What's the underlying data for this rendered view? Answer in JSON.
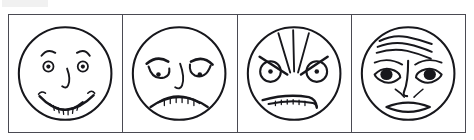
{
  "figure": {
    "panel_count": 4,
    "frame": {
      "stroke_color": "#4a4a52",
      "background": "#ffffff"
    },
    "ink_color": "#17171c"
  },
  "panels": [
    {
      "id": "panel-happy",
      "expression": "happy",
      "label": "Happy face",
      "features": {
        "eyes": "small round eyes with pupils",
        "eyebrows": "short arched brows",
        "nose": "single curved line",
        "mouth": "upturned smile with teeth row"
      }
    },
    {
      "id": "panel-sad",
      "expression": "sad",
      "label": "Sad face",
      "features": {
        "eyes": "droopy lidded eyes with pupils",
        "eyebrows": "inner-raised slanted brows",
        "nose": "single curved line",
        "mouth": "downturned frown with teeth row"
      }
    },
    {
      "id": "panel-angry",
      "expression": "angry",
      "label": "Angry face",
      "features": {
        "eyes": "round eyes with small pupils",
        "eyebrows": "sharp V brows with radiating furrow lines",
        "nose": "none visible",
        "mouth": "flat wavy mouth with teeth row"
      }
    },
    {
      "id": "panel-fear",
      "expression": "fear",
      "label": "Fearful face",
      "features": {
        "eyes": "large almond eyes with dark filled pupils",
        "eyebrows": "raised inner brows",
        "forehead": "horizontal wrinkle lines",
        "nose": "long line with nostril curves",
        "mouth": "open oval mouth"
      }
    }
  ]
}
